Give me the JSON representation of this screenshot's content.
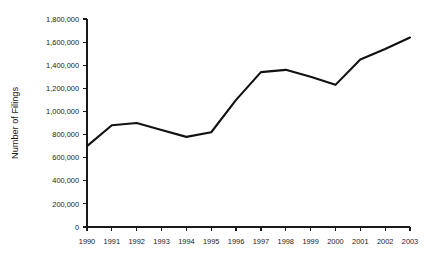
{
  "chart_data": {
    "type": "line",
    "title": "",
    "xlabel": "",
    "ylabel": "Number of Filings",
    "categories": [
      "1990",
      "1991",
      "1992",
      "1993",
      "1994",
      "1995",
      "1996",
      "1997",
      "1998",
      "1999",
      "2000",
      "2001",
      "2002",
      "2003"
    ],
    "values": [
      700000,
      880000,
      900000,
      840000,
      780000,
      820000,
      1100000,
      1340000,
      1360000,
      1300000,
      1230000,
      1450000,
      1540000,
      1640000
    ],
    "series": [
      {
        "name": "Number of Filings",
        "values": [
          700000,
          880000,
          900000,
          840000,
          780000,
          820000,
          1100000,
          1340000,
          1360000,
          1300000,
          1230000,
          1450000,
          1540000,
          1640000
        ]
      }
    ],
    "ylim": [
      0,
      1800000
    ],
    "ytick_values": [
      0,
      200000,
      400000,
      600000,
      800000,
      1000000,
      1200000,
      1400000,
      1600000,
      1800000
    ],
    "ytick_labels": [
      "0",
      "200,000",
      "400,000",
      "600,000",
      "800,000",
      "1,000,000",
      "1,200,000",
      "1,400,000",
      "1,600,000",
      "1,800,000"
    ],
    "xtick_labels": [
      "1990",
      "1991",
      "1992",
      "1993",
      "1994",
      "1995",
      "1996",
      "1997",
      "1998",
      "1999",
      "2000",
      "2001",
      "2002",
      "2003"
    ],
    "grid": false,
    "legend": false,
    "legend_position": "none",
    "line_color": "#111111",
    "axis_color": "#1a1a1a",
    "background_color": "#ffffff",
    "markers": false,
    "annotations": []
  }
}
